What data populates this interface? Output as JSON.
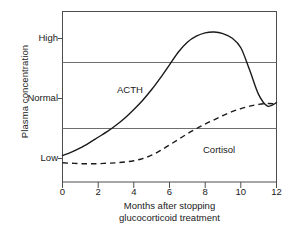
{
  "chart_data": {
    "type": "line",
    "title": "",
    "xlabel": "Months after stopping glucocorticoid treatment",
    "xlabel_line1": "Months after stopping",
    "xlabel_line2": "glucocorticoid treatment",
    "ylabel": "Plasma concentration",
    "xlim": [
      0,
      12
    ],
    "ylim": [
      0,
      4
    ],
    "xticks": [
      0,
      2,
      4,
      6,
      8,
      10,
      12
    ],
    "xtick_labels": [
      "0",
      "2",
      "4",
      "6",
      "8",
      "10",
      "12"
    ],
    "ytick_labels": [
      "High",
      "Normal",
      "Low"
    ],
    "ytick_values": [
      3.3,
      1.95,
      0.62
    ],
    "gridlines_y": [
      2.7,
      1.25
    ],
    "grid": true,
    "legend_position": "inline-annotation",
    "series": [
      {
        "name": "ACTH",
        "style": "solid",
        "color": "#1a1a1a",
        "x": [
          0,
          0.5,
          1,
          1.5,
          2,
          2.5,
          3,
          3.5,
          4,
          4.5,
          5,
          5.5,
          6,
          6.5,
          7,
          7.5,
          8,
          8.5,
          9,
          9.5,
          10,
          10.5,
          11,
          11.5,
          12
        ],
        "values": [
          0.62,
          0.7,
          0.8,
          0.92,
          1.05,
          1.18,
          1.33,
          1.5,
          1.7,
          1.92,
          2.17,
          2.45,
          2.75,
          3.05,
          3.28,
          3.42,
          3.5,
          3.52,
          3.48,
          3.38,
          3.15,
          2.62,
          2.05,
          1.78,
          1.86
        ]
      },
      {
        "name": "Cortisol",
        "style": "dashed",
        "color": "#1a1a1a",
        "x": [
          0,
          0.5,
          1,
          1.5,
          2,
          2.5,
          3,
          3.5,
          4,
          4.5,
          5,
          5.5,
          6,
          6.5,
          7,
          7.5,
          8,
          8.5,
          9,
          9.5,
          10,
          10.5,
          11,
          11.5,
          12
        ],
        "values": [
          0.45,
          0.44,
          0.43,
          0.43,
          0.43,
          0.44,
          0.45,
          0.47,
          0.5,
          0.55,
          0.63,
          0.74,
          0.87,
          1.0,
          1.13,
          1.25,
          1.36,
          1.46,
          1.56,
          1.65,
          1.72,
          1.78,
          1.82,
          1.84,
          1.83
        ]
      }
    ],
    "annotations": [
      {
        "text": "ACTH",
        "x": 3.1,
        "y": 2.55
      },
      {
        "text": "Cortisol",
        "x": 8.0,
        "y": 1.0
      }
    ]
  },
  "axis": {
    "y_title": "Plasma concentration",
    "x_title_line1": "Months after stopping",
    "x_title_line2": "glucocorticoid treatment",
    "y_labels": {
      "high": "High",
      "normal": "Normal",
      "low": "Low"
    },
    "x_labels": {
      "t0": "0",
      "t2": "2",
      "t4": "4",
      "t6": "6",
      "t8": "8",
      "t10": "10",
      "t12": "12"
    }
  },
  "series_labels": {
    "acth": "ACTH",
    "cortisol": "Cortisol"
  },
  "colors": {
    "line": "#1a1a1a",
    "frame": "#4d4d4d",
    "grid": "#6e6e6e",
    "background": "#ffffff",
    "text": "#1a1a1a"
  }
}
